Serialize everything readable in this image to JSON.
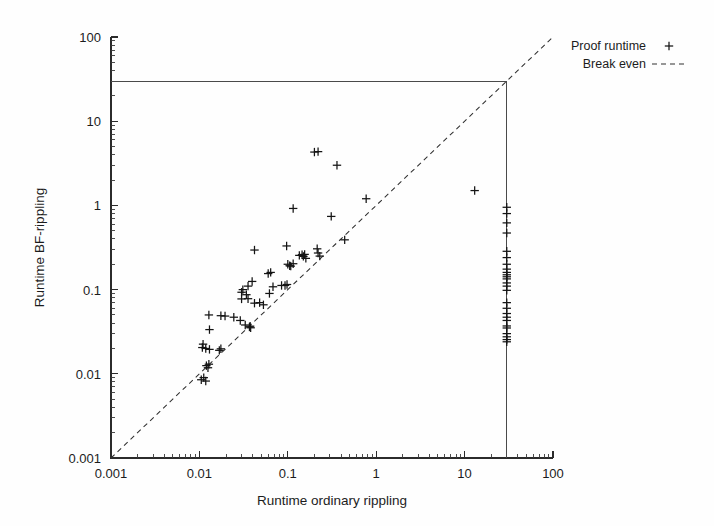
{
  "figure": {
    "background_color": "#fefefe",
    "ink_color": "#1a1a1a"
  },
  "chart_data": {
    "type": "scatter",
    "title": "",
    "xlabel": "Runtime ordinary rippling",
    "ylabel": "Runtime BF-rippling",
    "xscale": "log",
    "yscale": "log",
    "xlim": [
      0.001,
      100
    ],
    "ylim": [
      0.001,
      100
    ],
    "xticks": [
      0.001,
      0.01,
      0.1,
      1,
      10,
      100
    ],
    "xticklabels": [
      "0.001",
      "0.01",
      "0.1",
      "1",
      "10",
      "100"
    ],
    "yticks": [
      0.001,
      0.01,
      0.1,
      1,
      10,
      100
    ],
    "yticklabels": [
      "0.001",
      "0.01",
      "0.1",
      "1",
      "10",
      "100"
    ],
    "grid": false,
    "legend_position": "top-right",
    "legend": [
      {
        "label": "Proof runtime",
        "marker": "plus-marker"
      },
      {
        "label": "Break even",
        "marker": "dashed-line"
      }
    ],
    "series": [
      {
        "name": "Proof runtime",
        "marker": "+",
        "color": "#141414",
        "points": [
          [
            0.0105,
            0.0085
          ],
          [
            0.0112,
            0.009
          ],
          [
            0.0118,
            0.0082
          ],
          [
            0.012,
            0.0125
          ],
          [
            0.0125,
            0.0118
          ],
          [
            0.0128,
            0.013
          ],
          [
            0.0108,
            0.0205
          ],
          [
            0.011,
            0.0225
          ],
          [
            0.0118,
            0.02
          ],
          [
            0.013,
            0.0195
          ],
          [
            0.0168,
            0.019
          ],
          [
            0.0175,
            0.0198
          ],
          [
            0.013,
            0.0335
          ],
          [
            0.0128,
            0.05
          ],
          [
            0.0175,
            0.049
          ],
          [
            0.0195,
            0.0485
          ],
          [
            0.0245,
            0.047
          ],
          [
            0.029,
            0.043
          ],
          [
            0.033,
            0.038
          ],
          [
            0.0368,
            0.036
          ],
          [
            0.0375,
            0.0368
          ],
          [
            0.038,
            0.0352
          ],
          [
            0.03,
            0.0775
          ],
          [
            0.034,
            0.087
          ],
          [
            0.03,
            0.093
          ],
          [
            0.031,
            0.1
          ],
          [
            0.0355,
            0.11
          ],
          [
            0.0395,
            0.125
          ],
          [
            0.0355,
            0.078
          ],
          [
            0.042,
            0.069
          ],
          [
            0.048,
            0.07
          ],
          [
            0.053,
            0.066
          ],
          [
            0.062,
            0.09
          ],
          [
            0.068,
            0.108
          ],
          [
            0.085,
            0.112
          ],
          [
            0.093,
            0.112
          ],
          [
            0.098,
            0.115
          ],
          [
            0.06,
            0.155
          ],
          [
            0.064,
            0.16
          ],
          [
            0.042,
            0.295
          ],
          [
            0.1,
            0.2
          ],
          [
            0.105,
            0.192
          ],
          [
            0.108,
            0.19
          ],
          [
            0.115,
            0.203
          ],
          [
            0.097,
            0.33
          ],
          [
            0.135,
            0.255
          ],
          [
            0.145,
            0.26
          ],
          [
            0.15,
            0.248
          ],
          [
            0.155,
            0.262
          ],
          [
            0.16,
            0.235
          ],
          [
            0.22,
            0.272
          ],
          [
            0.23,
            0.25
          ],
          [
            0.215,
            0.305
          ],
          [
            0.115,
            0.92
          ],
          [
            0.2,
            4.3
          ],
          [
            0.22,
            4.35
          ],
          [
            0.31,
            0.74
          ],
          [
            0.36,
            3.0
          ],
          [
            0.44,
            0.39
          ],
          [
            0.77,
            1.2
          ],
          [
            13.0,
            1.5
          ],
          [
            30.0,
            0.95
          ],
          [
            30.0,
            0.8
          ],
          [
            30.0,
            0.62
          ],
          [
            30.0,
            0.47
          ],
          [
            30.0,
            0.285
          ],
          [
            30.0,
            0.24
          ],
          [
            30.0,
            0.2
          ],
          [
            30.0,
            0.175
          ],
          [
            30.0,
            0.16
          ],
          [
            30.0,
            0.15
          ],
          [
            30.0,
            0.142
          ],
          [
            30.0,
            0.134
          ],
          [
            30.0,
            0.12
          ],
          [
            30.0,
            0.11
          ],
          [
            30.0,
            0.098
          ],
          [
            30.0,
            0.07
          ],
          [
            30.0,
            0.06
          ],
          [
            30.0,
            0.052
          ],
          [
            30.0,
            0.047
          ],
          [
            30.0,
            0.043
          ],
          [
            30.0,
            0.037
          ],
          [
            30.0,
            0.035
          ],
          [
            30.0,
            0.03
          ],
          [
            30.0,
            0.0275
          ],
          [
            30.0,
            0.0255
          ],
          [
            30.0,
            0.024
          ]
        ]
      }
    ],
    "reference_lines": [
      {
        "name": "break-even",
        "style": "dashed",
        "from": [
          0.001,
          0.001
        ],
        "to": [
          100,
          100
        ]
      },
      {
        "name": "timeout-horizontal",
        "style": "solid",
        "from": [
          0.001,
          30
        ],
        "to": [
          30,
          30
        ]
      },
      {
        "name": "timeout-vertical",
        "style": "solid",
        "from": [
          30,
          0.001
        ],
        "to": [
          30,
          30
        ]
      }
    ]
  }
}
